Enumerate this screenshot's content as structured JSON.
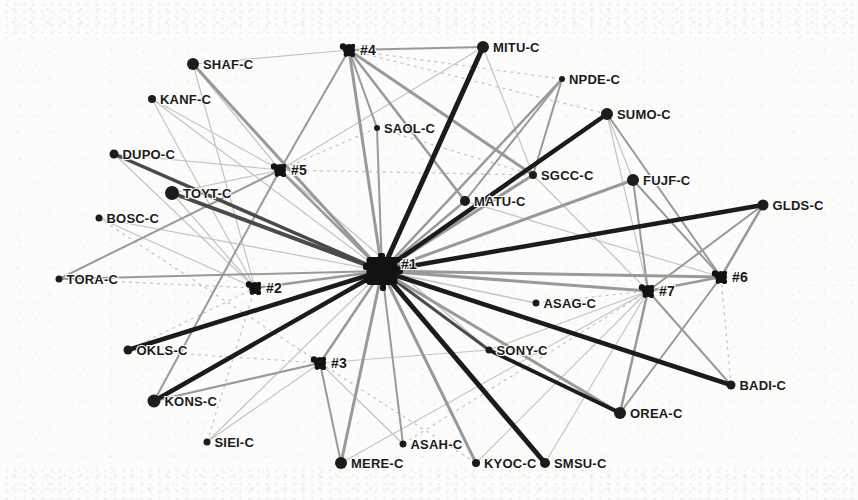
{
  "figure": {
    "kind": "scanned-network-diagram",
    "width": 858,
    "height": 500,
    "background": "#fcfcfa"
  },
  "palette": {
    "node_fill": "#1c1c1c",
    "hub_fill": "#121212",
    "label_color": "#1b1b1b",
    "edge_tones": {
      "l": "#c3c3c1",
      "m": "#999997",
      "d": "#4a4a48",
      "k": "#1b1b1a"
    }
  },
  "graph": {
    "nodes": [
      {
        "id": "SHAF-C",
        "label": "SHAF-C",
        "x": 193,
        "y": 64,
        "r": 6,
        "kind": "company"
      },
      {
        "id": "KANF-C",
        "label": "KANF-C",
        "x": 152,
        "y": 99,
        "r": 4,
        "kind": "company"
      },
      {
        "id": "DUPO-C",
        "label": "DUPO-C",
        "x": 114,
        "y": 154,
        "r": 4.5,
        "kind": "company"
      },
      {
        "id": "TOYT-C",
        "label": "TOYT-C",
        "x": 172,
        "y": 193,
        "r": 7,
        "kind": "company"
      },
      {
        "id": "BOSC-C",
        "label": "BOSC-C",
        "x": 99,
        "y": 218,
        "r": 3.5,
        "kind": "company"
      },
      {
        "id": "TORA-C",
        "label": "TORA-C",
        "x": 59,
        "y": 279,
        "r": 3.5,
        "kind": "company"
      },
      {
        "id": "OKLS-C",
        "label": "OKLS-C",
        "x": 128,
        "y": 350,
        "r": 4.5,
        "kind": "company"
      },
      {
        "id": "KONS-C",
        "label": "KONS-C",
        "x": 154,
        "y": 401,
        "r": 6.5,
        "kind": "company"
      },
      {
        "id": "SIEI-C",
        "label": "SIEI-C",
        "x": 207,
        "y": 442,
        "r": 3.5,
        "kind": "company"
      },
      {
        "id": "MERE-C",
        "label": "MERE-C",
        "x": 341,
        "y": 463,
        "r": 6,
        "kind": "company"
      },
      {
        "id": "ASAH-C",
        "label": "ASAH-C",
        "x": 403,
        "y": 444,
        "r": 3.5,
        "kind": "company"
      },
      {
        "id": "KYOC-C",
        "label": "KYOC-C",
        "x": 476,
        "y": 463,
        "r": 4,
        "kind": "company"
      },
      {
        "id": "SMSU-C",
        "label": "SMSU-C",
        "x": 545,
        "y": 463,
        "r": 5,
        "kind": "company"
      },
      {
        "id": "OREA-C",
        "label": "OREA-C",
        "x": 620,
        "y": 413,
        "r": 6,
        "kind": "company"
      },
      {
        "id": "BADI-C",
        "label": "BADI-C",
        "x": 731,
        "y": 385,
        "r": 4.5,
        "kind": "company"
      },
      {
        "id": "GLDS-C",
        "label": "GLDS-C",
        "x": 763,
        "y": 205,
        "r": 5.5,
        "kind": "company"
      },
      {
        "id": "FUJF-C",
        "label": "FUJF-C",
        "x": 633,
        "y": 180,
        "r": 6,
        "kind": "company"
      },
      {
        "id": "SUMO-C",
        "label": "SUMO-C",
        "x": 607,
        "y": 114,
        "r": 6,
        "kind": "company"
      },
      {
        "id": "NPDE-C",
        "label": "NPDE-C",
        "x": 562,
        "y": 79,
        "r": 3,
        "kind": "company"
      },
      {
        "id": "MITU-C",
        "label": "MITU-C",
        "x": 483,
        "y": 47,
        "r": 6,
        "kind": "company"
      },
      {
        "id": "SAOL-C",
        "label": "SAOL-C",
        "x": 377,
        "y": 128,
        "r": 3,
        "kind": "company"
      },
      {
        "id": "SGCC-C",
        "label": "SGCC-C",
        "x": 533,
        "y": 175,
        "r": 4,
        "kind": "company"
      },
      {
        "id": "MATU-C",
        "label": "MATU-C",
        "x": 465,
        "y": 201,
        "r": 5,
        "kind": "company"
      },
      {
        "id": "ASAG-C",
        "label": "ASAG-C",
        "x": 536,
        "y": 303,
        "r": 3.5,
        "kind": "company"
      },
      {
        "id": "SONY-C",
        "label": "SONY-C",
        "x": 489,
        "y": 350,
        "r": 3.5,
        "kind": "company"
      },
      {
        "id": "H1",
        "label": "#1",
        "x": 382,
        "y": 271,
        "r": 15,
        "kind": "hub-major",
        "ldx": 19,
        "ldy": -2
      },
      {
        "id": "H2",
        "label": "#2",
        "x": 255,
        "y": 288,
        "r": 7,
        "kind": "hub"
      },
      {
        "id": "H3",
        "label": "#3",
        "x": 320,
        "y": 363,
        "r": 7,
        "kind": "hub"
      },
      {
        "id": "H4",
        "label": "#4",
        "x": 349,
        "y": 50,
        "r": 7,
        "kind": "hub"
      },
      {
        "id": "H5",
        "label": "#5",
        "x": 280,
        "y": 170,
        "r": 7,
        "kind": "hub"
      },
      {
        "id": "H6",
        "label": "#6",
        "x": 721,
        "y": 277,
        "r": 7,
        "kind": "hub"
      },
      {
        "id": "H7",
        "label": "#7",
        "x": 648,
        "y": 291,
        "r": 7,
        "kind": "hub"
      }
    ],
    "edges": [
      {
        "a": "MITU-C",
        "b": "H1",
        "w": 5,
        "t": "k"
      },
      {
        "a": "SUMO-C",
        "b": "H1",
        "w": 4.5,
        "t": "k"
      },
      {
        "a": "GLDS-C",
        "b": "H1",
        "w": 4.5,
        "t": "k"
      },
      {
        "a": "BADI-C",
        "b": "H1",
        "w": 4.5,
        "t": "k"
      },
      {
        "a": "SMSU-C",
        "b": "H1",
        "w": 5,
        "t": "k"
      },
      {
        "a": "KONS-C",
        "b": "H1",
        "w": 4.5,
        "t": "k"
      },
      {
        "a": "OKLS-C",
        "b": "H1",
        "w": 4.5,
        "t": "k"
      },
      {
        "a": "SONY-C",
        "b": "OREA-C",
        "w": 4,
        "t": "k"
      },
      {
        "a": "TOYT-C",
        "b": "H1",
        "w": 4,
        "t": "d"
      },
      {
        "a": "DUPO-C",
        "b": "H1",
        "w": 3.5,
        "t": "d"
      },
      {
        "a": "SONY-C",
        "b": "H1",
        "w": 3,
        "t": "d"
      },
      {
        "a": "SHAF-C",
        "b": "H1",
        "w": 3,
        "t": "m"
      },
      {
        "a": "MERE-C",
        "b": "H1",
        "w": 3,
        "t": "m"
      },
      {
        "a": "KYOC-C",
        "b": "H1",
        "w": 3,
        "t": "m"
      },
      {
        "a": "OREA-C",
        "b": "H1",
        "w": 3,
        "t": "m"
      },
      {
        "a": "FUJF-C",
        "b": "H1",
        "w": 3,
        "t": "m"
      },
      {
        "a": "SGCC-C",
        "b": "H1",
        "w": 3,
        "t": "m"
      },
      {
        "a": "H4",
        "b": "H1",
        "w": 3,
        "t": "m"
      },
      {
        "a": "H7",
        "b": "H1",
        "w": 3,
        "t": "m"
      },
      {
        "a": "H6",
        "b": "H1",
        "w": 3,
        "t": "m"
      },
      {
        "a": "H5",
        "b": "H1",
        "w": 2.5,
        "t": "m"
      },
      {
        "a": "H2",
        "b": "H1",
        "w": 2.5,
        "t": "m"
      },
      {
        "a": "H3",
        "b": "H1",
        "w": 2.5,
        "t": "m"
      },
      {
        "a": "NPDE-C",
        "b": "H1",
        "w": 2.5,
        "t": "m"
      },
      {
        "a": "MATU-C",
        "b": "H1",
        "w": 2.5,
        "t": "m"
      },
      {
        "a": "SAOL-C",
        "b": "H1",
        "w": 2,
        "t": "m"
      },
      {
        "a": "TORA-C",
        "b": "H1",
        "w": 2,
        "t": "m"
      },
      {
        "a": "ASAH-C",
        "b": "H1",
        "w": 2,
        "t": "m"
      },
      {
        "a": "SGCC-C",
        "b": "H4",
        "w": 3,
        "t": "m"
      },
      {
        "a": "MATU-C",
        "b": "H4",
        "w": 2.5,
        "t": "m"
      },
      {
        "a": "SAOL-C",
        "b": "H4",
        "w": 2,
        "t": "m"
      },
      {
        "a": "MITU-C",
        "b": "H4",
        "w": 2,
        "t": "m"
      },
      {
        "a": "H5",
        "b": "H4",
        "w": 2,
        "t": "m"
      },
      {
        "a": "NPDE-C",
        "b": "SGCC-C",
        "w": 2,
        "t": "m"
      },
      {
        "a": "NPDE-C",
        "b": "MATU-C",
        "w": 2,
        "t": "m"
      },
      {
        "a": "TORA-C",
        "b": "H5",
        "w": 2,
        "t": "m"
      },
      {
        "a": "KONS-C",
        "b": "H5",
        "w": 2,
        "t": "m"
      },
      {
        "a": "KONS-C",
        "b": "H3",
        "w": 2,
        "t": "m"
      },
      {
        "a": "MERE-C",
        "b": "H3",
        "w": 2,
        "t": "m"
      },
      {
        "a": "GLDS-C",
        "b": "H6",
        "w": 2.5,
        "t": "m"
      },
      {
        "a": "GLDS-C",
        "b": "H7",
        "w": 2,
        "t": "m"
      },
      {
        "a": "H6",
        "b": "H7",
        "w": 2.5,
        "t": "m"
      },
      {
        "a": "FUJF-C",
        "b": "H7",
        "w": 2,
        "t": "m"
      },
      {
        "a": "FUJF-C",
        "b": "H6",
        "w": 2,
        "t": "m"
      },
      {
        "a": "SUMO-C",
        "b": "H6",
        "w": 2,
        "t": "m"
      },
      {
        "a": "OREA-C",
        "b": "H7",
        "w": 2.5,
        "t": "m"
      },
      {
        "a": "OREA-C",
        "b": "H6",
        "w": 2,
        "t": "m"
      },
      {
        "a": "BADI-C",
        "b": "H7",
        "w": 2,
        "t": "m"
      },
      {
        "a": "SHAF-C",
        "b": "H4",
        "w": 1.2,
        "t": "l"
      },
      {
        "a": "SHAF-C",
        "b": "H5",
        "w": 1.2,
        "t": "l"
      },
      {
        "a": "SHAF-C",
        "b": "H2",
        "w": 1.2,
        "t": "l"
      },
      {
        "a": "KANF-C",
        "b": "H1",
        "w": 1.2,
        "t": "l"
      },
      {
        "a": "KANF-C",
        "b": "H2",
        "w": 1.2,
        "t": "l"
      },
      {
        "a": "KANF-C",
        "b": "H5",
        "w": 1.2,
        "t": "l"
      },
      {
        "a": "DUPO-C",
        "b": "H2",
        "w": 1.2,
        "t": "l"
      },
      {
        "a": "DUPO-C",
        "b": "H5",
        "w": 1.2,
        "t": "l"
      },
      {
        "a": "TOYT-C",
        "b": "H5",
        "w": 1.2,
        "t": "l"
      },
      {
        "a": "TOYT-C",
        "b": "H2",
        "w": 1.2,
        "t": "l"
      },
      {
        "a": "BOSC-C",
        "b": "H1",
        "w": 1.2,
        "t": "l"
      },
      {
        "a": "BOSC-C",
        "b": "H2",
        "w": 1.2,
        "t": "l"
      },
      {
        "a": "BOSC-C",
        "b": "H3",
        "w": 1.2,
        "t": "l",
        "d": 1
      },
      {
        "a": "TORA-C",
        "b": "H2",
        "w": 1.2,
        "t": "l",
        "d": 1
      },
      {
        "a": "OKLS-C",
        "b": "H2",
        "w": 1.2,
        "t": "l",
        "d": 1
      },
      {
        "a": "OKLS-C",
        "b": "H3",
        "w": 1.2,
        "t": "l",
        "d": 1
      },
      {
        "a": "SIEI-C",
        "b": "H1",
        "w": 1.2,
        "t": "l"
      },
      {
        "a": "SIEI-C",
        "b": "H3",
        "w": 1.2,
        "t": "l"
      },
      {
        "a": "SIEI-C",
        "b": "H2",
        "w": 1.2,
        "t": "l",
        "d": 1
      },
      {
        "a": "MERE-C",
        "b": "H7",
        "w": 1.2,
        "t": "l"
      },
      {
        "a": "ASAH-C",
        "b": "H3",
        "w": 1.2,
        "t": "l"
      },
      {
        "a": "ASAH-C",
        "b": "H7",
        "w": 1.2,
        "t": "l",
        "d": 1
      },
      {
        "a": "KYOC-C",
        "b": "H7",
        "w": 1.2,
        "t": "l"
      },
      {
        "a": "KYOC-C",
        "b": "H3",
        "w": 1.2,
        "t": "l",
        "d": 1
      },
      {
        "a": "SMSU-C",
        "b": "H7",
        "w": 1.2,
        "t": "l"
      },
      {
        "a": "SONY-C",
        "b": "H7",
        "w": 1.2,
        "t": "l"
      },
      {
        "a": "SONY-C",
        "b": "H3",
        "w": 1.2,
        "t": "l"
      },
      {
        "a": "SONY-C",
        "b": "H5",
        "w": 1.2,
        "t": "l"
      },
      {
        "a": "ASAG-C",
        "b": "H1",
        "w": 1.5,
        "t": "l"
      },
      {
        "a": "ASAG-C",
        "b": "H7",
        "w": 1.2,
        "t": "l",
        "d": 1
      },
      {
        "a": "BADI-C",
        "b": "H6",
        "w": 1.2,
        "t": "l",
        "d": 1
      },
      {
        "a": "SUMO-C",
        "b": "H7",
        "w": 1.2,
        "t": "l"
      },
      {
        "a": "SUMO-C",
        "b": "FUJF-C",
        "w": 1.2,
        "t": "l"
      },
      {
        "a": "SUMO-C",
        "b": "H4",
        "w": 1.2,
        "t": "l",
        "d": 1
      },
      {
        "a": "NPDE-C",
        "b": "H4",
        "w": 1.2,
        "t": "l",
        "d": 1
      },
      {
        "a": "MITU-C",
        "b": "SGCC-C",
        "w": 1.2,
        "t": "l"
      },
      {
        "a": "MITU-C",
        "b": "H5",
        "w": 1.2,
        "t": "l"
      },
      {
        "a": "SAOL-C",
        "b": "H5",
        "w": 1.2,
        "t": "l",
        "d": 1
      },
      {
        "a": "SAOL-C",
        "b": "SGCC-C",
        "w": 1.2,
        "t": "l",
        "d": 1
      },
      {
        "a": "SGCC-C",
        "b": "H5",
        "w": 1.2,
        "t": "l",
        "d": 1
      },
      {
        "a": "SGCC-C",
        "b": "H7",
        "w": 1.2,
        "t": "l"
      },
      {
        "a": "MATU-C",
        "b": "H6",
        "w": 1.2,
        "t": "l"
      }
    ]
  }
}
